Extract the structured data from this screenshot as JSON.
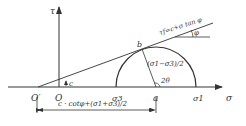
{
  "diagram": {
    "axes": {
      "x_label": "σ",
      "y_label": "τ"
    },
    "points": {
      "origin": "O",
      "origin_prime": "O′",
      "sigma3": "σ3",
      "center": "a",
      "sigma1": "σ1",
      "tangent": "b"
    },
    "annotations": {
      "envelope": "τf=c+σ tan φ",
      "phi": "φ",
      "cohesion": "c",
      "radius": "(σ1−σ3)/2",
      "angle": "2θ",
      "distance": "c · cotφ+(σ1+σ3)/2"
    },
    "colors": {
      "line": "#333333"
    }
  }
}
